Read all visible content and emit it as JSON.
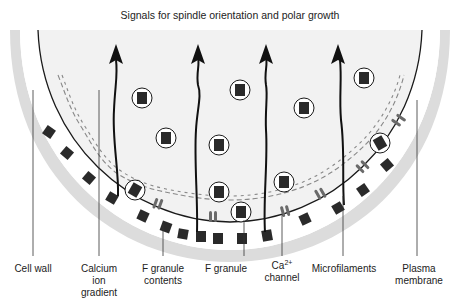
{
  "title": "Signals for spindle orientation and polar growth",
  "labels": {
    "cell_wall": "Cell wall",
    "calcium_ion_gradient": [
      "Calcium",
      "ion",
      "gradient"
    ],
    "f_granule_contents": [
      "F granule",
      "contents"
    ],
    "f_granule": "F granule",
    "ca_channel": {
      "base": "Ca",
      "superscript": "2+",
      "line2": "channel"
    },
    "microfilaments": "Microfilaments",
    "plasma_membrane": [
      "Plasma",
      "membrane"
    ]
  },
  "colors": {
    "background": "#ffffff",
    "cytoplasm": "#f2f2f2",
    "cell_wall_band": "#dcdcdc",
    "dark_fill": "#2a2a2a",
    "channel": "#6a6a6a",
    "line": "#1a1a1a"
  }
}
